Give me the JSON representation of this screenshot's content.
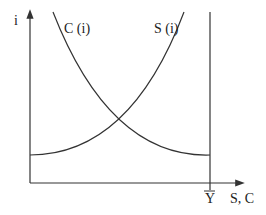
{
  "diagram": {
    "y_axis_label": "i",
    "x_axis_label": "S, C",
    "x_marker_label": "Y",
    "curves": [
      {
        "name": "consumption",
        "label": "C (i)",
        "shape": "decreasing-convex"
      },
      {
        "name": "saving",
        "label": "S (i)",
        "shape": "increasing-convex"
      }
    ],
    "vertical_line": "Y-bar (total income)",
    "colors": {
      "line": "#333333",
      "background": "#ffffff"
    }
  }
}
